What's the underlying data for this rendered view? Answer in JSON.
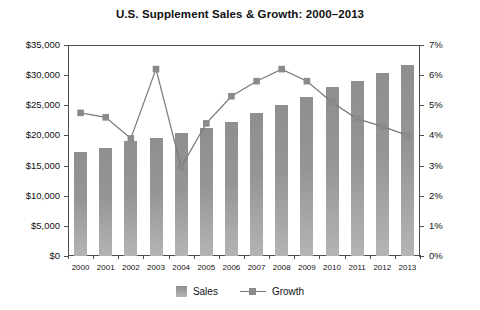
{
  "chart_data": {
    "type": "bar",
    "title": "U.S. Supplement Sales & Growth: 2000–2013",
    "xlabel": "",
    "ylabel": "",
    "categories": [
      "2000",
      "2001",
      "2002",
      "2003",
      "2004",
      "2005",
      "2006",
      "2007",
      "2008",
      "2009",
      "2010",
      "2011",
      "2012",
      "2013"
    ],
    "series": [
      {
        "name": "Sales",
        "type": "bar",
        "axis": "left",
        "values": [
          17300,
          17900,
          19000,
          19600,
          20400,
          21300,
          22200,
          23700,
          25000,
          26400,
          28100,
          29000,
          30400,
          31700
        ]
      },
      {
        "name": "Growth",
        "type": "line",
        "axis": "right",
        "values": [
          4.75,
          4.6,
          3.9,
          6.2,
          2.95,
          4.4,
          5.3,
          5.8,
          6.2,
          5.8,
          5.1,
          4.55,
          4.3,
          4.0
        ]
      }
    ],
    "ylim_left": [
      0,
      35000
    ],
    "ylim_right": [
      0,
      7
    ],
    "ytick_left": [
      "$0",
      "$5,000",
      "$10,000",
      "$15,000",
      "$20,000",
      "$25,000",
      "$30,000",
      "$35,000"
    ],
    "ytick_left_values": [
      0,
      5000,
      10000,
      15000,
      20000,
      25000,
      30000,
      35000
    ],
    "ytick_right": [
      "0%",
      "1%",
      "2%",
      "3%",
      "4%",
      "5%",
      "6%",
      "7%"
    ],
    "ytick_right_values": [
      0,
      1,
      2,
      3,
      4,
      5,
      6,
      7
    ],
    "grid": false,
    "legend_position": "bottom",
    "colors": {
      "bar_top": "#8f8f8f",
      "bar_bottom": "#b4b4b4",
      "line": "#7a7a7a",
      "marker": "#8a8a8a",
      "axis": "#4d4d4d",
      "text": "#111111",
      "background": "#ffffff"
    }
  },
  "legend": {
    "items": [
      {
        "label": "Sales"
      },
      {
        "label": "Growth"
      }
    ]
  }
}
